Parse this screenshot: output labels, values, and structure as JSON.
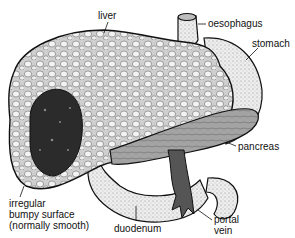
{
  "labels": {
    "liver": "liver",
    "oesophagus": "oesophagus",
    "stomach": "stomach",
    "pancreas": "pancreas",
    "irregular_line1": "irregular",
    "irregular_line2": "bumpy surface",
    "irregular_line3": "(normally smooth)",
    "duodenum": "duodenum",
    "portal_line1": "portal",
    "portal_line2": "vein"
  },
  "colors": {
    "outline": "#111111",
    "liver_fill": "#d8d8d8",
    "nodule_fill": "#f2f2f2",
    "dark_lesion": "#2a2a2a",
    "pancreas_fill": "#9a9a9a",
    "stomach_fill": "#e6e6e6",
    "vein_fill": "#555555"
  }
}
